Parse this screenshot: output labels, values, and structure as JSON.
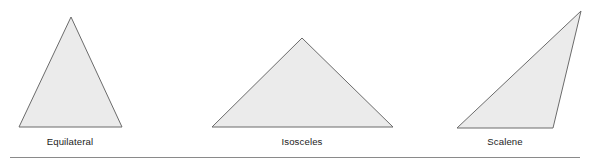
{
  "figure": {
    "caption_row": "Triangle classification by side lengths",
    "background_color": "#ffffff",
    "width": 594,
    "height": 163
  },
  "style": {
    "fill_color": "#ebebeb",
    "stroke_color": "#6b6b6b",
    "stroke_width": 1,
    "label_color": "#1c1c1c",
    "rule_color": "#8a8a8a"
  },
  "shapes": [
    {
      "id": "equilateral",
      "label": "Equilateral",
      "icon_name": "equilateral-triangle-icon",
      "points": "71,17 122,127 19,127",
      "apex": [
        71,
        17
      ],
      "base_left": [
        19,
        127
      ],
      "base_right": [
        122,
        127
      ],
      "label_x": 70,
      "label_y": 136
    },
    {
      "id": "isosceles",
      "label": "Isosceles",
      "icon_name": "isosceles-triangle-icon",
      "points": "302,38 393,127 212,127",
      "apex": [
        302,
        38
      ],
      "base_left": [
        212,
        127
      ],
      "base_right": [
        393,
        127
      ],
      "label_x": 302,
      "label_y": 136
    },
    {
      "id": "scalene",
      "label": "Scalene",
      "icon_name": "scalene-triangle-icon",
      "points": "581,11 553,128 457,128",
      "apex": [
        581,
        11
      ],
      "base_left": [
        457,
        128
      ],
      "base_right": [
        553,
        128
      ],
      "label_x": 505,
      "label_y": 136
    }
  ],
  "divider": {
    "name": "bottom-rule",
    "x1": 10,
    "y1": 157,
    "x2": 580,
    "y2": 157
  }
}
